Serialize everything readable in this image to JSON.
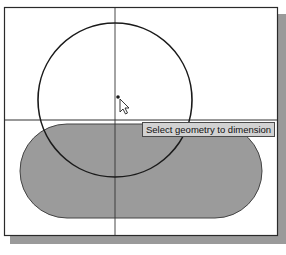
{
  "viewport": {
    "background": "#ffffff",
    "shadow_color": "#9a9a9a",
    "frame_color": "#2a2a2a"
  },
  "sketch": {
    "axes": {
      "vertical_x": 115,
      "horizontal_y": 120,
      "color": "#333333"
    },
    "circle": {
      "cx": 115,
      "cy": 100,
      "r": 77,
      "stroke": "#1a1a1a"
    },
    "slot": {
      "x": 20,
      "y": 124,
      "width": 242,
      "height": 94,
      "rx": 47,
      "fill": "#9b9b9b",
      "stroke": "#444444"
    },
    "point": {
      "x": 118,
      "y": 97
    }
  },
  "tooltip": {
    "text": "Select geometry to dimension"
  },
  "cursor": {
    "type": "arrow-pointer",
    "x": 121,
    "y": 99
  }
}
